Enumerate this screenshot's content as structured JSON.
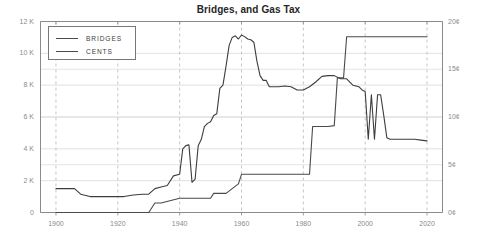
{
  "chart_data": {
    "type": "line",
    "title": "Bridges, and Gas Tax",
    "xlabel": "",
    "ylabel": "",
    "grid": true,
    "legend_position": "top-left",
    "xlim": [
      1895,
      2025
    ],
    "x_ticks": [
      "1900",
      "1920",
      "1940",
      "1960",
      "1980",
      "2000",
      "2020"
    ],
    "x_tick_values": [
      1900,
      1920,
      1940,
      1960,
      1980,
      2000,
      2020
    ],
    "axes": {
      "left": {
        "label": "",
        "ylim": [
          0,
          12000
        ],
        "ticks": [
          "0",
          "2 K",
          "4 K",
          "6 K",
          "8 K",
          "10 K",
          "12 K"
        ],
        "tick_values": [
          0,
          2000,
          4000,
          6000,
          8000,
          10000,
          12000
        ]
      },
      "right": {
        "label": "",
        "ylim": [
          0,
          20
        ],
        "ticks": [
          "0¢",
          "5¢",
          "10¢",
          "15¢",
          "20¢"
        ],
        "tick_values": [
          0,
          5,
          10,
          15,
          20
        ]
      }
    },
    "series": [
      {
        "name": "BRIDGES",
        "axis": "left",
        "color": "#3d3d3d",
        "x": [
          1900,
          1903,
          1906,
          1908,
          1911,
          1914,
          1918,
          1922,
          1925,
          1928,
          1930,
          1932,
          1934,
          1936,
          1938,
          1940,
          1941,
          1942,
          1943,
          1944,
          1945,
          1946,
          1947,
          1948,
          1949,
          1950,
          1951,
          1952,
          1953,
          1954,
          1955,
          1956,
          1957,
          1958,
          1959,
          1960,
          1961,
          1962,
          1963,
          1964,
          1965,
          1966,
          1967,
          1968,
          1969,
          1970,
          1971,
          1972,
          1974,
          1976,
          1978,
          1980,
          1982,
          1984,
          1986,
          1988,
          1990,
          1992,
          1994,
          1996,
          1998,
          1999,
          2000,
          2001,
          2002,
          2003,
          2004,
          2005,
          2006,
          2007,
          2008,
          2010,
          2012,
          2014,
          2016,
          2018,
          2020
        ],
        "y": [
          1500,
          1500,
          1500,
          1150,
          1000,
          1000,
          1000,
          1000,
          1100,
          1150,
          1150,
          1500,
          1600,
          1700,
          2300,
          2400,
          4000,
          4200,
          4250,
          1900,
          2100,
          4200,
          4600,
          5400,
          5600,
          5700,
          6100,
          6200,
          7800,
          8000,
          9200,
          10500,
          11000,
          11100,
          10900,
          11150,
          11050,
          10900,
          10850,
          10700,
          9500,
          8600,
          8300,
          8300,
          7900,
          7900,
          7900,
          7900,
          7950,
          7900,
          7700,
          7700,
          7900,
          8200,
          8550,
          8600,
          8600,
          8400,
          8400,
          8000,
          7900,
          7700,
          7600,
          4600,
          7400,
          4600,
          7400,
          7400,
          6100,
          4700,
          4600,
          4600,
          4600,
          4600,
          4600,
          4550,
          4500
        ],
        "notes": "Number of bridges; peak ~11,150 near 1960, dip to ~1,900 in 1944, sharp V-dips and spike in early 2000s, plateau ~4,500 after 2008"
      },
      {
        "name": "CENTS",
        "axis": "right",
        "color": "#4a4a4a",
        "x": [
          1900,
          1930,
          1932,
          1933,
          1934,
          1940,
          1950,
          1951,
          1955,
          1959,
          1960,
          1970,
          1975,
          1980,
          1982,
          1983,
          1984,
          1988,
          1990,
          1991,
          1992,
          1993,
          1994,
          2000,
          2010,
          2020
        ],
        "y": [
          0,
          0,
          1.0,
          1.0,
          1.0,
          1.5,
          1.5,
          2.0,
          2.0,
          3.0,
          4.0,
          4.0,
          4.0,
          4.0,
          4.0,
          9.0,
          9.0,
          9.0,
          9.1,
          14.1,
          14.1,
          14.1,
          18.4,
          18.4,
          18.4,
          18.4
        ],
        "notes": "Federal gas tax in cents; steps at 1932 (1¢), 1951 (2¢), 1959 (3¢), 1960 (4¢), 1983 (9¢), 1990 (9.1¢), 1991 (14.1¢), 1993 (18.4¢ plateau)"
      }
    ],
    "legend": [
      {
        "label": "BRIDGES"
      },
      {
        "label": "CENTS"
      }
    ]
  },
  "colors": {
    "line": "#3d3d3d",
    "grid": "#d4d4d4",
    "dashed_grid": "#b8b8b8",
    "axis": "#8a8a8a",
    "tick_text": "#8a8a8a",
    "title_text": "#262626",
    "background": "#ffffff",
    "legend_border": "#777777"
  }
}
